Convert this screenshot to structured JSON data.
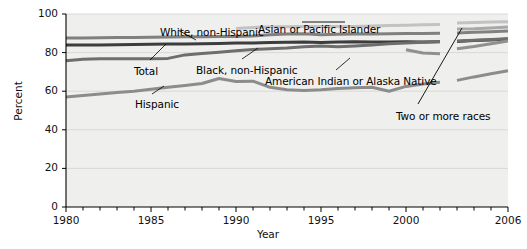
{
  "chart_data": {
    "type": "line",
    "title": "",
    "xlabel": "Year",
    "ylabel": "Percent",
    "xlim": [
      1980,
      2006
    ],
    "ylim": [
      0,
      100
    ],
    "ytick_values": [
      0,
      20,
      40,
      60,
      80,
      100
    ],
    "ytick_labels": [
      "0",
      "20",
      "40",
      "60",
      "80",
      "100"
    ],
    "xtick_values": [
      1980,
      1985,
      1990,
      1995,
      2000,
      2006
    ],
    "xtick_labels": [
      "1980",
      "1985",
      "1990",
      "1995",
      "2000",
      "2006"
    ],
    "minor_xticks_every": 1,
    "grid": "horizontal-faint",
    "legend": "inline-annotations",
    "break_note": "series show a discontinuity (gap) between 2002 and 2003",
    "break_years": [
      2002,
      2003
    ],
    "x": [
      1980,
      1981,
      1982,
      1983,
      1984,
      1985,
      1986,
      1987,
      1988,
      1989,
      1990,
      1991,
      1992,
      1993,
      1994,
      1995,
      1996,
      1997,
      1998,
      1999,
      2000,
      2001,
      2002,
      2003,
      2004,
      2005,
      2006
    ],
    "series": [
      {
        "name": "Total",
        "label": "Total",
        "color": "#3d3d3d",
        "width": 3.0,
        "values": [
          83.9,
          83.9,
          84.0,
          84.1,
          84.2,
          84.3,
          84.4,
          84.5,
          84.6,
          84.7,
          84.9,
          85.0,
          85.2,
          85.4,
          85.5,
          85.3,
          85.5,
          85.6,
          85.5,
          85.5,
          85.6,
          85.5,
          85.6,
          85.8,
          86.2,
          86.6,
          87.0
        ]
      },
      {
        "name": "White, non-Hispanic",
        "label": "White, non-Hispanic",
        "color": "#808080",
        "width": 3.0,
        "values": [
          87.5,
          87.6,
          87.7,
          87.8,
          87.9,
          88.0,
          88.1,
          88.2,
          88.2,
          88.3,
          88.4,
          88.6,
          89.2,
          89.6,
          89.8,
          89.2,
          89.5,
          89.6,
          89.7,
          89.8,
          89.9,
          89.9,
          90.0,
          90.2,
          90.5,
          90.8,
          91.2
        ]
      },
      {
        "name": "Black, non-Hispanic",
        "label": "Black, non-Hispanic",
        "color": "#6e6e6e",
        "width": 3.0,
        "values": [
          75.8,
          76.6,
          76.8,
          76.8,
          76.8,
          76.8,
          77.0,
          78.8,
          79.6,
          80.2,
          81.0,
          81.6,
          82.0,
          82.4,
          83.0,
          83.4,
          83.0,
          83.4,
          84.0,
          84.6,
          85.0,
          85.4,
          85.8,
          86.0,
          86.4,
          86.8,
          87.2
        ]
      },
      {
        "name": "Hispanic",
        "label": "Hispanic",
        "color": "#8c8c8c",
        "width": 3.0,
        "values": [
          57.0,
          57.8,
          58.6,
          59.4,
          60.0,
          61.0,
          62.0,
          63.0,
          64.0,
          66.6,
          65.0,
          65.2,
          62.0,
          60.8,
          60.4,
          60.8,
          61.4,
          61.8,
          62.0,
          60.0,
          62.5,
          63.8,
          64.6,
          65.6,
          67.4,
          69.0,
          70.6
        ]
      },
      {
        "name": "Asian or Pacific Islander",
        "label": "Asian or Pacific Islander",
        "color": "#c2c2c2",
        "width": 3.0,
        "values": [
          null,
          null,
          null,
          null,
          null,
          null,
          null,
          null,
          null,
          null,
          92.5,
          93.0,
          93.4,
          93.4,
          93.6,
          93.6,
          93.6,
          93.6,
          93.8,
          94.0,
          94.2,
          94.4,
          94.6,
          95.4,
          95.6,
          95.8,
          96.0
        ]
      },
      {
        "name": "American Indian or Alaska Native",
        "label": "American Indian or Alaska Native",
        "color": "#909090",
        "width": 3.0,
        "values": [
          null,
          null,
          null,
          null,
          null,
          null,
          null,
          null,
          null,
          null,
          null,
          null,
          null,
          null,
          null,
          null,
          null,
          null,
          null,
          null,
          81.5,
          79.8,
          79.4,
          82.0,
          83.2,
          84.6,
          86.0
        ]
      },
      {
        "name": "Two or more races",
        "label": "Two or more races",
        "color": "#a8a8a8",
        "width": 3.0,
        "values": [
          null,
          null,
          null,
          null,
          null,
          null,
          null,
          null,
          null,
          null,
          null,
          null,
          null,
          null,
          null,
          null,
          null,
          null,
          null,
          null,
          null,
          null,
          null,
          92.2,
          92.4,
          92.8,
          93.2
        ]
      }
    ],
    "annotations": [
      {
        "text": "White, non-Hispanic",
        "x_px": 160,
        "y_px": 26
      },
      {
        "text": "Asian or Pacific Islander",
        "x_px": 258,
        "y_px": 23
      },
      {
        "text": "Total",
        "x_px": 134,
        "y_px": 65
      },
      {
        "text": "Black, non-Hispanic",
        "x_px": 196,
        "y_px": 64
      },
      {
        "text": "American Indian or Alaska Native",
        "x_px": 265,
        "y_px": 75
      },
      {
        "text": "Hispanic",
        "x_px": 135,
        "y_px": 98
      },
      {
        "text": "Two or more races",
        "x_px": 396,
        "y_px": 110
      }
    ]
  }
}
